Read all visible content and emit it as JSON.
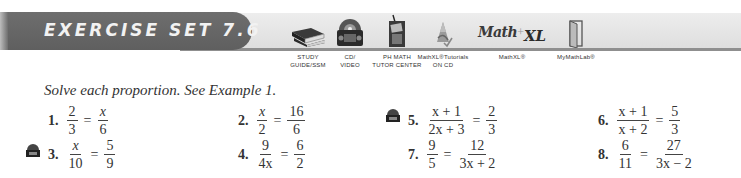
{
  "banner": {
    "title": "EXERCISE SET 7.6",
    "color_pill": "#666666",
    "color_strip": "#e6e6e6"
  },
  "resources": [
    {
      "icon": "study-guide-book-icon",
      "line1": "STUDY",
      "line2": "GUIDE/SSM"
    },
    {
      "icon": "cd-video-icon",
      "line1": "CD/",
      "line2": "VIDEO"
    },
    {
      "icon": "phone-tutor-icon",
      "line1": "PH MATH",
      "line2": "TUTOR CENTER"
    },
    {
      "icon": "mathxl-tutorials-cd-icon",
      "line1": "MathXL®Tutorials",
      "line2": "ON CD"
    },
    {
      "icon": "mathxl-logo-icon",
      "line1": "MathXL®",
      "line2": ""
    },
    {
      "icon": "mymathlab-door-icon",
      "line1": "MyMathLab®",
      "line2": ""
    }
  ],
  "mathxl_logo": {
    "left": "Math",
    "right": "XL"
  },
  "instructions": "Solve each proportion. See Example 1.",
  "exercises": [
    {
      "num": "1.",
      "lhs": {
        "n": "2",
        "d": "3"
      },
      "rhs": {
        "n": "x",
        "d": "6"
      },
      "cd": false
    },
    {
      "num": "2.",
      "lhs": {
        "n": "x",
        "d": "2"
      },
      "rhs": {
        "n": "16",
        "d": "6"
      },
      "cd": false
    },
    {
      "num": "3.",
      "lhs": {
        "n": "x",
        "d": "10"
      },
      "rhs": {
        "n": "5",
        "d": "9"
      },
      "cd": true
    },
    {
      "num": "4.",
      "lhs": {
        "n": "9",
        "d": "4x"
      },
      "rhs": {
        "n": "6",
        "d": "2"
      },
      "cd": false
    },
    {
      "num": "5.",
      "lhs": {
        "n": "x + 1",
        "d": "2x + 3"
      },
      "rhs": {
        "n": "2",
        "d": "3"
      },
      "cd": true
    },
    {
      "num": "6.",
      "lhs": {
        "n": "x + 1",
        "d": "x + 2"
      },
      "rhs": {
        "n": "5",
        "d": "3"
      },
      "cd": false
    },
    {
      "num": "7.",
      "lhs": {
        "n": "9",
        "d": "5"
      },
      "rhs": {
        "n": "12",
        "d": "3x + 2"
      },
      "cd": false
    },
    {
      "num": "8.",
      "lhs": {
        "n": "6",
        "d": "11"
      },
      "rhs": {
        "n": "27",
        "d": "3x − 2"
      },
      "cd": false
    }
  ],
  "equals": "="
}
